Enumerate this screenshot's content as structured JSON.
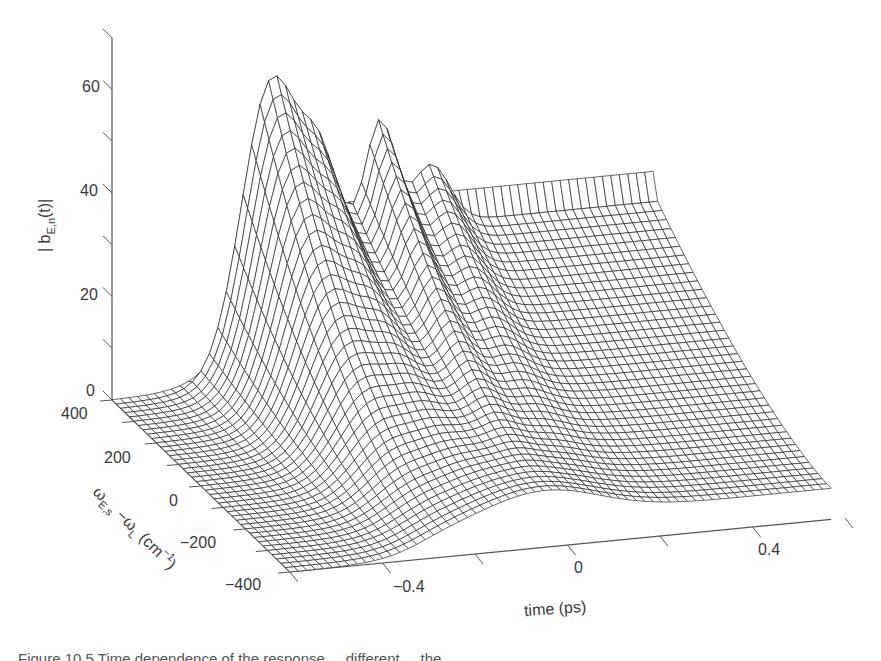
{
  "chart_data": {
    "type": "surface",
    "title": "",
    "xlabel": "time (ps)",
    "ylabel": "ω_{E,s} − ω_L (cm^-1)",
    "zlabel": "|b_{E,n}(t)|",
    "x_ticks": [
      "-0.4",
      "0",
      "0.4"
    ],
    "x_tick_values": [
      -0.4,
      0,
      0.4
    ],
    "y_ticks": [
      "400",
      "200",
      "0",
      "-200",
      "-400"
    ],
    "y_tick_values": [
      400,
      200,
      0,
      -200,
      -400
    ],
    "z_ticks": [
      "0",
      "20",
      "40",
      "60"
    ],
    "z_tick_values": [
      0,
      20,
      40,
      60
    ],
    "xlim": [
      -0.6,
      0.57
    ],
    "ylim": [
      -400,
      400
    ],
    "zlim": [
      0,
      70
    ],
    "grid": false,
    "legend": null,
    "render": "wireframe mesh, black lines on white",
    "features": [
      {
        "description": "main peak",
        "time_ps": -0.27,
        "freq_cm1": 380,
        "height": 46
      },
      {
        "description": "secondary peak",
        "time_ps": -0.03,
        "freq_cm1": 380,
        "height": 34
      },
      {
        "description": "side ripples",
        "time_ps": [
          -0.16,
          0.08
        ],
        "height": 24
      },
      {
        "description": "late-time plateau (high freq edge)",
        "time_ps": 0.5,
        "freq_cm1": 400,
        "height": 30
      },
      {
        "description": "late-time plateau (mid freq)",
        "time_ps": 0.5,
        "freq_cm1": 200,
        "height": 21
      },
      {
        "description": "late-time plateau (low freq)",
        "time_ps": 0.5,
        "freq_cm1": 0,
        "height": 15
      },
      {
        "description": "flat floor before rise",
        "time_ps": [
          -0.6,
          -0.4
        ],
        "height": 0
      }
    ]
  },
  "axes": {
    "z": {
      "label_main": "| b",
      "label_sub": "E,n",
      "label_tail": "(t)|",
      "ticks": [
        {
          "label": "60",
          "value": 60
        },
        {
          "label": "40",
          "value": 40
        },
        {
          "label": "20",
          "value": 20
        },
        {
          "label": "0",
          "value": 0
        }
      ]
    },
    "y": {
      "label_omega1": "ω",
      "label_sub1": "E,s",
      "label_mid": " −ω",
      "label_sub2": "L",
      "label_tail": " (cm",
      "label_sup": "−1",
      "label_close": ")",
      "ticks": [
        {
          "label": "400",
          "value": 400
        },
        {
          "label": "200",
          "value": 200
        },
        {
          "label": "0",
          "value": 0
        },
        {
          "label": "−200",
          "value": -200
        },
        {
          "label": "−400",
          "value": -400
        }
      ]
    },
    "x": {
      "label": "time (ps)",
      "ticks": [
        {
          "label": "−0.4",
          "value": -0.4
        },
        {
          "label": "0",
          "value": 0
        },
        {
          "label": "0.4",
          "value": 0.4
        }
      ]
    }
  },
  "caption": {
    "text": "Figure 10.5  Time dependence of the response ... different ... the ..."
  },
  "colors": {
    "line": "#2a2a2a",
    "axis": "#555555",
    "background": "#ffffff"
  }
}
